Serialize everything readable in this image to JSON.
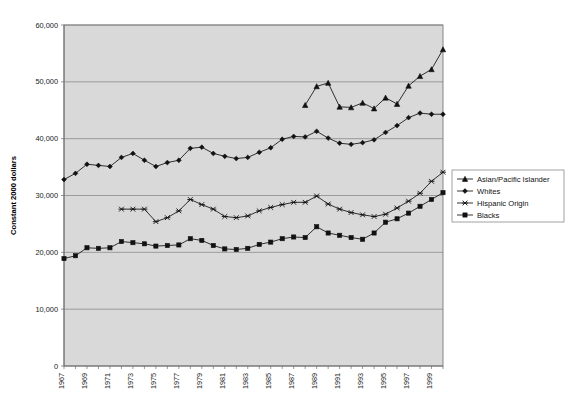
{
  "chart_data": {
    "type": "line",
    "title": "",
    "xlabel": "",
    "ylabel": "Constant 2000 dollars",
    "ylim": [
      0,
      60000
    ],
    "ytick_values": [
      0,
      10000,
      20000,
      30000,
      40000,
      50000,
      60000
    ],
    "ytick_labels": [
      "0",
      "10,000",
      "20,000",
      "30,000",
      "40,000",
      "50,000",
      "60,000"
    ],
    "xlim": [
      1967,
      2000
    ],
    "xtick_labels": [
      "1967",
      "1969",
      "1971",
      "1973",
      "1975",
      "1977",
      "1979",
      "1981",
      "1983",
      "1985",
      "1987",
      "1989",
      "1991",
      "1993",
      "1995",
      "1997",
      "1999"
    ],
    "x": [
      1967,
      1968,
      1969,
      1970,
      1971,
      1972,
      1973,
      1974,
      1975,
      1976,
      1977,
      1978,
      1979,
      1980,
      1981,
      1982,
      1983,
      1984,
      1985,
      1986,
      1987,
      1988,
      1989,
      1990,
      1991,
      1992,
      1993,
      1994,
      1995,
      1996,
      1997,
      1998,
      1999,
      2000
    ],
    "grid": true,
    "legend_position": "right",
    "plot_background": "#d9d9d9",
    "series": [
      {
        "name": "Asian/Pacific Islander",
        "marker": "triangle",
        "color": "#111111",
        "x": [
          1988,
          1989,
          1990,
          1991,
          1992,
          1993,
          1994,
          1995,
          1996,
          1997,
          1998,
          1999,
          2000
        ],
        "values": [
          45900,
          49200,
          49800,
          45600,
          45500,
          46300,
          45300,
          47200,
          46100,
          49300,
          51000,
          52200,
          55700
        ]
      },
      {
        "name": "Whites",
        "marker": "diamond",
        "color": "#111111",
        "x": [
          1967,
          1968,
          1969,
          1970,
          1971,
          1972,
          1973,
          1974,
          1975,
          1976,
          1977,
          1978,
          1979,
          1980,
          1981,
          1982,
          1983,
          1984,
          1985,
          1986,
          1987,
          1988,
          1989,
          1990,
          1991,
          1992,
          1993,
          1994,
          1995,
          1996,
          1997,
          1998,
          1999,
          2000
        ],
        "values": [
          32800,
          33900,
          35500,
          35300,
          35100,
          36700,
          37400,
          36200,
          35100,
          35800,
          36200,
          38300,
          38500,
          37400,
          36900,
          36500,
          36700,
          37600,
          38400,
          39900,
          40400,
          40300,
          41300,
          40100,
          39200,
          39000,
          39300,
          39800,
          41100,
          42300,
          43700,
          44500,
          44300,
          44300
        ]
      },
      {
        "name": "Hispanic Origin",
        "marker": "x",
        "color": "#111111",
        "x": [
          1972,
          1973,
          1974,
          1975,
          1976,
          1977,
          1978,
          1979,
          1980,
          1981,
          1982,
          1983,
          1984,
          1985,
          1986,
          1987,
          1988,
          1989,
          1990,
          1991,
          1992,
          1993,
          1994,
          1995,
          1996,
          1997,
          1998,
          1999,
          2000
        ],
        "values": [
          27600,
          27600,
          27600,
          25400,
          26100,
          27300,
          29300,
          28400,
          27600,
          26300,
          26100,
          26400,
          27300,
          27900,
          28400,
          28800,
          28800,
          29900,
          28500,
          27600,
          27000,
          26600,
          26300,
          26700,
          27800,
          29000,
          30400,
          32500,
          34100
        ]
      },
      {
        "name": "Blacks",
        "marker": "square",
        "color": "#111111",
        "x": [
          1967,
          1968,
          1969,
          1970,
          1971,
          1972,
          1973,
          1974,
          1975,
          1976,
          1977,
          1978,
          1979,
          1980,
          1981,
          1982,
          1983,
          1984,
          1985,
          1986,
          1987,
          1988,
          1989,
          1990,
          1991,
          1992,
          1993,
          1994,
          1995,
          1996,
          1997,
          1998,
          1999,
          2000
        ],
        "values": [
          18900,
          19400,
          20800,
          20700,
          20800,
          21900,
          21700,
          21500,
          21100,
          21200,
          21300,
          22400,
          22100,
          21200,
          20600,
          20500,
          20700,
          21400,
          21800,
          22400,
          22700,
          22600,
          24500,
          23400,
          23000,
          22600,
          22300,
          23400,
          25300,
          25900,
          26900,
          28100,
          29300,
          30500
        ]
      }
    ]
  },
  "legend": {
    "entries": [
      {
        "label": "Asian/Pacific Islander",
        "marker": "triangle"
      },
      {
        "label": "Whites",
        "marker": "diamond"
      },
      {
        "label": "Hispanic Origin",
        "marker": "x"
      },
      {
        "label": "Blacks",
        "marker": "square"
      }
    ]
  }
}
